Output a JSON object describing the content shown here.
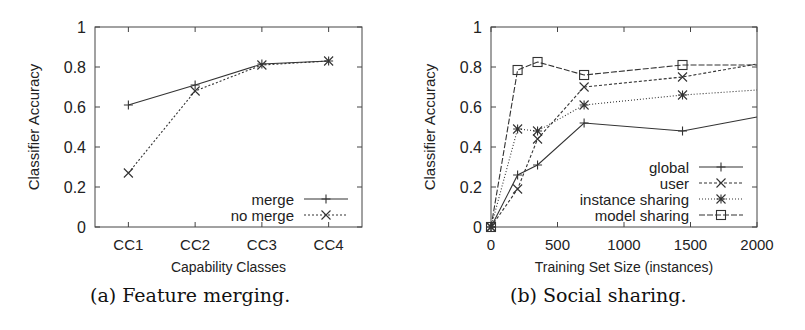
{
  "figures": [
    {
      "caption": "(a) Feature merging.",
      "xlabel": "Capability Classes",
      "ylabel": "Classifier Accuracy"
    },
    {
      "caption": "(b) Social sharing.",
      "xlabel": "Training Set Size (instances)",
      "ylabel": "Classifier Accuracy"
    }
  ],
  "chart_data": [
    {
      "type": "line",
      "title": "(a) Feature merging.",
      "xlabel": "Capability Classes",
      "ylabel": "Classifier Accuracy",
      "categories": [
        "CC1",
        "CC2",
        "CC3",
        "CC4"
      ],
      "ylim": [
        0,
        1
      ],
      "yticks": [
        0,
        0.2,
        0.4,
        0.6,
        0.8,
        1
      ],
      "ytick_labels": [
        "0",
        "0.2",
        "0.4",
        "0.6",
        "0.8",
        "1"
      ],
      "grid": false,
      "legend_position": "lower right",
      "series": [
        {
          "name": "merge",
          "marker": "plus",
          "dash": "",
          "values": [
            0.61,
            0.71,
            0.815,
            0.83
          ]
        },
        {
          "name": "no merge",
          "marker": "x",
          "dash": "2,2",
          "values": [
            0.27,
            0.68,
            0.81,
            0.83
          ]
        }
      ]
    },
    {
      "type": "line",
      "title": "(b) Social sharing.",
      "xlabel": "Training Set Size (instances)",
      "ylabel": "Classifier Accuracy",
      "x": [
        0,
        200,
        350,
        700,
        1440,
        2000
      ],
      "xlim": [
        0,
        2000
      ],
      "xticks": [
        0,
        500,
        1000,
        1500,
        2000
      ],
      "ylim": [
        0,
        1
      ],
      "yticks": [
        0,
        0.2,
        0.4,
        0.6,
        0.8,
        1
      ],
      "ytick_labels": [
        "0",
        "0.2",
        "0.4",
        "0.6",
        "0.8",
        "1"
      ],
      "grid": false,
      "legend_position": "lower right",
      "series": [
        {
          "name": "global",
          "marker": "plus",
          "dash": "",
          "values": [
            0,
            0.26,
            0.31,
            0.52,
            0.48,
            0.55
          ]
        },
        {
          "name": "user",
          "marker": "x",
          "dash": "3,2",
          "values": [
            0,
            0.19,
            0.44,
            0.7,
            0.75,
            0.815
          ]
        },
        {
          "name": "instance sharing",
          "marker": "star",
          "dash": "1,2",
          "values": [
            0,
            0.49,
            0.48,
            0.61,
            0.66,
            0.685
          ]
        },
        {
          "name": "model sharing",
          "marker": "square",
          "dash": "6,2",
          "values": [
            0,
            0.785,
            0.825,
            0.76,
            0.81,
            0.81
          ]
        }
      ]
    }
  ]
}
